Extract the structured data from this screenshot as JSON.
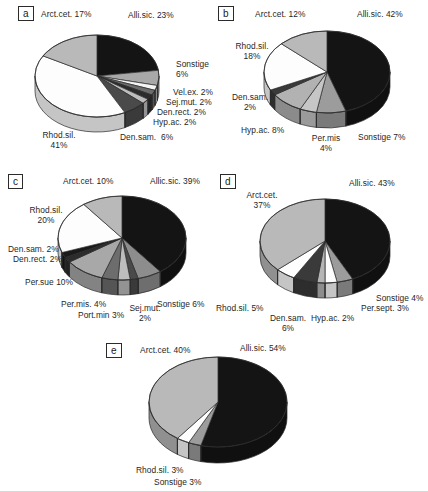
{
  "figure": {
    "type": "multi-panel-figure",
    "panel_count": 5
  },
  "chart_data": [
    {
      "id": "a",
      "panel_letter": "a",
      "type": "pie",
      "three_d": true,
      "title": "",
      "categories": [
        "Alli.sic.",
        "Sonstige",
        "Vel.ex.",
        "Sej.mut.",
        "Den.rect.",
        "Hyp.ac.",
        "Den.sam.",
        "Rhod.sil.",
        "Arct.cet."
      ],
      "values": [
        23,
        6,
        2,
        2,
        2,
        2,
        6,
        41,
        17
      ],
      "labels": [
        "Alli.sic. 23%",
        "Sonstige\n6%",
        "Vel.ex. 2%",
        "Sej.mut. 2%",
        "Den.rect. 2%",
        "Hyp.ac. 2%",
        "Den.sam.  6%",
        "Rhod.sil.\n41%",
        "Arct.cet. 17%"
      ],
      "fills": [
        "#141414",
        "#a8a8a8",
        "#f4f4f4",
        "#6d6d6d",
        "#2c2c2c",
        "#bdbdbd",
        "#4a4a4a",
        "#fdfdfd",
        "#b9b9b9"
      ],
      "legend": "none"
    },
    {
      "id": "b",
      "panel_letter": "b",
      "type": "pie",
      "three_d": true,
      "title": "",
      "categories": [
        "Alli.sic.",
        "Sonstige",
        "Per.mis",
        "Hyp.ac.",
        "Den.sam.",
        "Rhod.sil.",
        "Arct.cet."
      ],
      "values": [
        42,
        7,
        4,
        8,
        2,
        18,
        12
      ],
      "labels": [
        "Alli.sic. 42%",
        "Sonstige 7%",
        "Per.mis\n4%",
        "Hyp.ac. 8%",
        "Den.sam.\n2%",
        "Rhod.sil.\n18%",
        "Arct.cet. 12%"
      ],
      "fills": [
        "#141414",
        "#9c9c9c",
        "#c6c6c6",
        "#b2b2b2",
        "#3a3a3a",
        "#fdfdfd",
        "#b9b9b9"
      ],
      "legend": "none"
    },
    {
      "id": "c",
      "panel_letter": "c",
      "type": "pie",
      "three_d": true,
      "title": "",
      "categories": [
        "Allic.sic.",
        "Sonstige",
        "Sej.mut.",
        "Port.min",
        "Per.mis.",
        "Per.sue",
        "Den.rect.",
        "Den.sam.",
        "Rhod.sil.",
        "Arct.cet."
      ],
      "values": [
        39,
        6,
        2,
        3,
        4,
        10,
        2,
        2,
        20,
        10
      ],
      "labels": [
        "Allic.sic. 39%",
        "Sonstige 6%",
        "Sej.mut.\n2%",
        "Port.min 3%",
        "Per.mis. 4%",
        "Per.sue 10%",
        "Den.rect. 2%",
        "Den.sam. 2%",
        "Rhod.sil.\n20%",
        "Arct.cet. 10%"
      ],
      "fills": [
        "#141414",
        "#8d8d8d",
        "#4a4a4a",
        "#bdbdbd",
        "#6d6d6d",
        "#a8a8a8",
        "#2c2c2c",
        "#1a1a1a",
        "#fdfdfd",
        "#b9b9b9"
      ],
      "legend": "none"
    },
    {
      "id": "d",
      "panel_letter": "d",
      "type": "pie",
      "three_d": true,
      "title": "",
      "categories": [
        "Alli.sic.",
        "Sonstige",
        "Per.sept.",
        "Hyp.ac.",
        "Den.sam.",
        "Rhod.sil.",
        "Arct.cet."
      ],
      "values": [
        43,
        4,
        3,
        2,
        6,
        5,
        37
      ],
      "labels": [
        "Alli.sic. 43%",
        "Sonstige 4%",
        "Per.sept. 3%",
        "Hyp.ac. 2%",
        "Den.sam.\n6%",
        "Rhod.sil. 5%",
        "Arct.cet.\n37%"
      ],
      "fills": [
        "#141414",
        "#9c9c9c",
        "#fdfdfd",
        "#b5b5b5",
        "#3a3a3a",
        "#fdfdfd",
        "#b9b9b9"
      ],
      "legend": "none"
    },
    {
      "id": "e",
      "panel_letter": "e",
      "type": "pie",
      "three_d": true,
      "title": "",
      "categories": [
        "Alli.sic.",
        "Sonstige",
        "Rhod.sil.",
        "Arct.cet."
      ],
      "values": [
        54,
        3,
        3,
        40
      ],
      "labels": [
        "Alli.sic. 54%",
        "Sonstige 3%",
        "Rhod.sil. 3%",
        "Arct.cet. 40%"
      ],
      "fills": [
        "#141414",
        "#9c9c9c",
        "#fdfdfd",
        "#b9b9b9"
      ],
      "legend": "none"
    }
  ],
  "panels": {
    "a": {
      "letter": "a",
      "labels": {
        "arct": "Arct.cet. 17%",
        "alli": "Alli.sic. 23%",
        "sonstige_1": "Sonstige",
        "sonstige_2": "6%",
        "velex": "Vel.ex. 2%",
        "sejmut": "Sej.mut. 2%",
        "denrect": "Den.rect. 2%",
        "hypac": "Hyp.ac. 2%",
        "densam": "Den.sam.  6%",
        "rhod_1": "Rhod.sil.",
        "rhod_2": "41%"
      }
    },
    "b": {
      "letter": "b",
      "labels": {
        "arct": "Arct.cet. 12%",
        "alli": "Alli.sic. 42%",
        "rhod_1": "Rhod.sil.",
        "rhod_2": "18%",
        "densam_1": "Den.sam.",
        "densam_2": "2%",
        "hypac": "Hyp.ac. 8%",
        "permis_1": "Per.mis",
        "permis_2": "4%",
        "sonstige": "Sonstige 7%"
      }
    },
    "c": {
      "letter": "c",
      "labels": {
        "arct": "Arct.cet. 10%",
        "alli": "Allic.sic. 39%",
        "rhod_1": "Rhod.sil.",
        "rhod_2": "20%",
        "densam": "Den.sam. 2%",
        "denrect": "Den.rect. 2%",
        "persue": "Per.sue 10%",
        "permis": "Per.mis. 4%",
        "portmin": "Port.min 3%",
        "sejmut_1": "Sej.mut.",
        "sejmut_2": "2%",
        "sonstige": "Sonstige 6%"
      }
    },
    "d": {
      "letter": "d",
      "labels": {
        "arct_1": "Arct.cet.",
        "arct_2": "37%",
        "alli": "Alli.sic. 43%",
        "sonstige": "Sonstige 4%",
        "persept": "Per.sept. 3%",
        "hypac": "Hyp.ac. 2%",
        "densam_1": "Den.sam.",
        "densam_2": "6%",
        "rhod": "Rhod.sil. 5%"
      }
    },
    "e": {
      "letter": "e",
      "labels": {
        "arct": "Arct.cet. 40%",
        "alli": "Alli.sic. 54%",
        "rhod": "Rhod.sil. 3%",
        "sonstige": "Sonstige 3%"
      }
    }
  }
}
